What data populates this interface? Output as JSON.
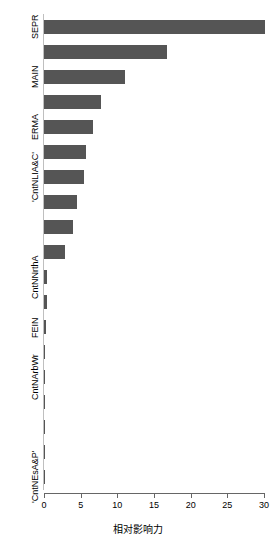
{
  "chart_data": {
    "type": "bar",
    "orientation": "horizontal",
    "title": "",
    "xlabel": "相对影响力",
    "ylabel": "",
    "xlim": [
      0,
      30.5
    ],
    "xticks": [
      0,
      5,
      10,
      15,
      20,
      25,
      30
    ],
    "xtick_labels": [
      "0",
      "5",
      "10",
      "15",
      "20",
      "25",
      "30"
    ],
    "grid": false,
    "legend": "none",
    "bar_color": "#555555",
    "axis_color": "#666666",
    "categories": [
      "SEPR",
      "'CntNLvngA'",
      "MAIN",
      "'CntNSocSc'",
      "ERMA",
      "'CntNMath'",
      "'CntNLIA&C'",
      "'CntNBus'",
      "'CntNEng'",
      "'CntNHlth'",
      "CntNNrthA",
      "'CntNEdu'",
      "FEIN",
      "'CntNArts'",
      "CntNArbWr",
      "'CntNAgri'",
      "'CntNLaw'",
      "'CntNSrvc'",
      "'CntNEsA&P'"
    ],
    "values": [
      30.2,
      16.8,
      11.1,
      7.8,
      6.7,
      5.7,
      5.4,
      4.5,
      4.0,
      2.9,
      0.45,
      0.4,
      0.3,
      0.12,
      0.1,
      0.08,
      0.06,
      0.05,
      0.04
    ],
    "visible_ytick_labels": [
      {
        "label": "SEPR",
        "category_index": 0
      },
      {
        "label": "MAIN",
        "category_index": 2
      },
      {
        "label": "ERMA",
        "category_index": 4
      },
      {
        "label": "'CntNLIA&C'",
        "category_index": 6
      },
      {
        "label": "CntNNrthA",
        "category_index": 10
      },
      {
        "label": "FEIN",
        "category_index": 12
      },
      {
        "label": "CntNArbWr",
        "category_index": 14
      },
      {
        "label": "'CntNEsA&P'",
        "category_index": 18
      }
    ]
  }
}
